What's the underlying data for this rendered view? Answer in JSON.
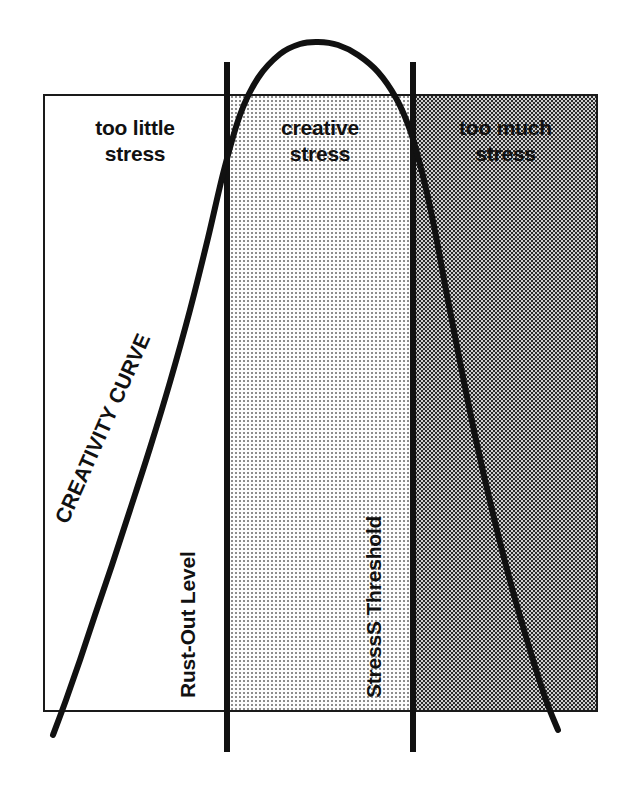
{
  "diagram": {
    "frame": {
      "x": 43,
      "y": 94,
      "width": 555,
      "height": 618,
      "border_color": "#1a1a1a"
    },
    "zones": [
      {
        "id": "too-little",
        "label": "too little\nstress",
        "fill": "white",
        "fill_color": "#ffffff",
        "x_start": 43,
        "x_end": 227
      },
      {
        "id": "creative",
        "label": "creative\nstress",
        "fill": "light-dot-screen",
        "fill_color": "#ededed",
        "x_start": 227,
        "x_end": 413
      },
      {
        "id": "too-much",
        "label": "too much\nstress",
        "fill": "dark-checker-screen",
        "fill_color": "#9a9a9a",
        "x_start": 413,
        "x_end": 598
      }
    ],
    "boundaries": [
      {
        "id": "rust-out-level",
        "label": "Rust-Out Level",
        "x": 227,
        "rotation": -90
      },
      {
        "id": "stress-threshold",
        "label": "StressS Threshold",
        "x": 413,
        "rotation": -90
      }
    ],
    "curve": {
      "label": "CREATIVITY CURVE",
      "label_rotation": -66,
      "stroke_color": "#111111",
      "stroke_width": 6
    }
  },
  "chart_data": {
    "type": "line",
    "xlabel": "",
    "ylabel": "",
    "grid": false,
    "legend": "none",
    "annotations": [
      "too little stress",
      "creative stress",
      "too much stress",
      "Rust-Out Level",
      "StressS Threshold",
      "CREATIVITY CURVE"
    ],
    "series": [
      {
        "name": "CREATIVITY CURVE",
        "points": [
          [
            53,
            735
          ],
          [
            66,
            700
          ],
          [
            80,
            660
          ],
          [
            95,
            615
          ],
          [
            112,
            565
          ],
          [
            130,
            510
          ],
          [
            150,
            448
          ],
          [
            170,
            382
          ],
          [
            190,
            310
          ],
          [
            208,
            238
          ],
          [
            224,
            170
          ],
          [
            240,
            115
          ],
          [
            258,
            78
          ],
          [
            280,
            54
          ],
          [
            300,
            44
          ],
          [
            318,
            42
          ],
          [
            338,
            45
          ],
          [
            358,
            55
          ],
          [
            378,
            72
          ],
          [
            396,
            98
          ],
          [
            410,
            130
          ],
          [
            422,
            172
          ],
          [
            434,
            226
          ],
          [
            446,
            290
          ],
          [
            460,
            362
          ],
          [
            476,
            440
          ],
          [
            494,
            518
          ],
          [
            512,
            588
          ],
          [
            530,
            650
          ],
          [
            546,
            700
          ],
          [
            558,
            730
          ]
        ]
      }
    ],
    "x_boundaries": [
      {
        "label": "Rust-Out Level",
        "x": 227
      },
      {
        "label": "StressS Threshold",
        "x": 413
      }
    ],
    "regions": [
      {
        "label": "too little stress",
        "x_range": [
          43,
          227
        ],
        "shade": "none"
      },
      {
        "label": "creative stress",
        "x_range": [
          227,
          413
        ],
        "shade": "light"
      },
      {
        "label": "too much stress",
        "x_range": [
          413,
          598
        ],
        "shade": "dark"
      }
    ]
  }
}
